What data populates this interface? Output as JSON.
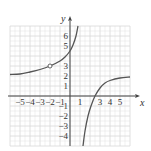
{
  "chart_data": {
    "type": "line",
    "title": "",
    "xlabel": "x",
    "ylabel": "y",
    "xlim": [
      -6,
      6
    ],
    "ylim": [
      -5,
      7
    ],
    "grid": true,
    "x_tick_labels": [
      "-5",
      "-4",
      "-3",
      "-2",
      "-1",
      "1",
      "3",
      "4",
      "5"
    ],
    "x_tick_values": [
      -5,
      -4,
      -3,
      -2,
      -1,
      1,
      3,
      4,
      5
    ],
    "y_tick_labels": [
      "6",
      "5",
      "3",
      "2",
      "1",
      "-1",
      "-2",
      "-3",
      "-4"
    ],
    "y_tick_values": [
      6,
      5,
      3,
      2,
      1,
      -1,
      -2,
      -3,
      -4
    ],
    "series": [
      {
        "name": "left branch",
        "points": [
          [
            -6,
            2.15
          ],
          [
            -5,
            2.2
          ],
          [
            -4,
            2.4
          ],
          [
            -3,
            2.65
          ],
          [
            -2,
            3
          ],
          [
            -1,
            3.5
          ],
          [
            -0.5,
            3.9
          ],
          [
            0,
            4.5
          ],
          [
            0.3,
            5.1
          ],
          [
            0.6,
            6.0
          ],
          [
            0.8,
            7.0
          ]
        ]
      },
      {
        "name": "right branch",
        "points": [
          [
            1.3,
            -5
          ],
          [
            1.5,
            -3.5
          ],
          [
            1.8,
            -2
          ],
          [
            2.1,
            -1
          ],
          [
            2.5,
            0
          ],
          [
            3,
            0.8
          ],
          [
            3.5,
            1.3
          ],
          [
            4,
            1.55
          ],
          [
            5,
            1.8
          ],
          [
            6,
            1.9
          ]
        ]
      }
    ],
    "annotations": [
      {
        "type": "open-circle",
        "x": -2,
        "y": 3
      }
    ],
    "asymptotes": {
      "vertical": [
        1
      ],
      "horizontal": [
        2
      ]
    }
  },
  "colors": {
    "curve": "#555555",
    "grid": "#d8d8d8",
    "axis": "#444444"
  }
}
